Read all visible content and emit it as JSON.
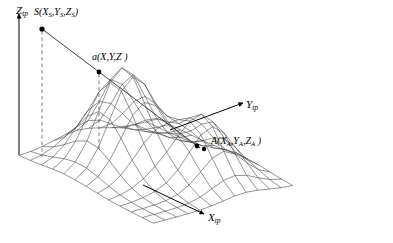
{
  "figure": {
    "title": "",
    "background_color": "#ffffff",
    "line_color": "#2b2b2b",
    "point_color": "#000000",
    "width": 393,
    "height": 243
  },
  "axes": [
    {
      "id": "z",
      "base": "Z",
      "subscript": "tp",
      "direction": "up",
      "label": "Z"
    },
    {
      "id": "y",
      "base": "Y",
      "subscript": "tp",
      "direction": "right",
      "label": "Y"
    },
    {
      "id": "x",
      "base": "X",
      "subscript": "tp",
      "direction": "down-right",
      "label": "X"
    }
  ],
  "points": [
    {
      "id": "S",
      "name": "S",
      "coords": "(X_S, Y_S, Z_S)",
      "base": "S",
      "open": "(",
      "c1": "X",
      "c1sub": "S",
      "sep1": ",",
      "c2": "Y",
      "c2sub": "S",
      "sep2": ",",
      "c3": "Z",
      "c3sub": "S",
      "close": ")",
      "has_drop_line": true
    },
    {
      "id": "a",
      "name": "a",
      "coords": "(X,Y,Z)",
      "base": "a",
      "open": "(",
      "c1": "X",
      "c1sub": "",
      "sep1": ",",
      "c2": "Y",
      "c2sub": "",
      "sep2": ",",
      "c3": "Z",
      "c3sub": "",
      "close": " )",
      "has_drop_line": true
    },
    {
      "id": "A",
      "name": "A",
      "coords": "(X_A, Y_A, Z_A)",
      "base": "A",
      "open": "(",
      "c1": "X",
      "c1sub": "A",
      "sep1": ",",
      "c2": "Y",
      "c2sub": "A",
      "sep2": ",",
      "c3": "Z",
      "c3sub": "A",
      "close": " )",
      "has_drop_line": false
    }
  ],
  "chart_data": {
    "type": "surface",
    "title": "",
    "xlabel": "X_tp",
    "ylabel": "Y_tp",
    "zlabel": "Z_tp",
    "grid": true,
    "legend": false,
    "surface": {
      "nx": 13,
      "ny": 13,
      "peaks": [
        {
          "cx": 0.36,
          "cy": 0.42,
          "amplitude": 1.0,
          "sigma": 0.17
        },
        {
          "cx": 0.68,
          "cy": 0.66,
          "amplitude": 0.62,
          "sigma": 0.15
        }
      ],
      "basins": [
        {
          "cx": 0.52,
          "cy": 0.58,
          "amplitude": -0.18,
          "sigma": 0.1
        }
      ]
    },
    "ray": {
      "from": "S",
      "through": "a",
      "to": "A",
      "points_px": [
        [
          42,
          29
        ],
        [
          99,
          72
        ],
        [
          198,
          147
        ]
      ]
    },
    "drop_lines": [
      {
        "point": "S",
        "from_px": [
          42,
          29
        ],
        "to_px": [
          42,
          156
        ]
      },
      {
        "point": "a",
        "from_px": [
          99,
          72
        ],
        "to_px": [
          99,
          148
        ]
      }
    ],
    "points_px": {
      "S": [
        42,
        29
      ],
      "a": [
        99,
        72
      ],
      "A": [
        198,
        147
      ],
      "A_marker2": [
        204,
        149
      ]
    },
    "axis_origin_px": [
      19,
      155
    ],
    "z_axis_top_px": [
      19,
      12
    ]
  }
}
